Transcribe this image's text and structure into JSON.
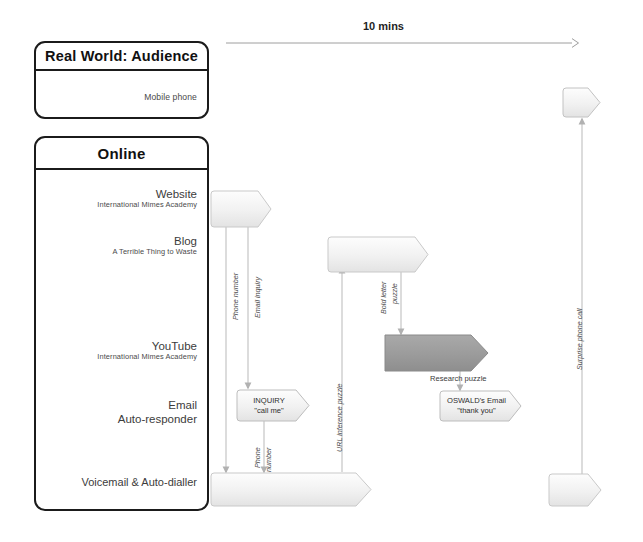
{
  "diagram": {
    "timeline": {
      "label": "10 mins"
    },
    "panels": [
      {
        "id": "real-world",
        "title": "Real World: Audience",
        "lanes": [
          {
            "title": "Mobile phone",
            "sub": ""
          }
        ]
      },
      {
        "id": "online",
        "title": "Online",
        "lanes": [
          {
            "title": "Website",
            "sub": "International Mimes Academy"
          },
          {
            "title": "Blog",
            "sub": "A Terrible Thing to Waste"
          },
          {
            "title": "YouTube",
            "sub": "International Mimes Academy"
          },
          {
            "title": "Email",
            "sub": "Auto-responder"
          },
          {
            "title": "Voicemail & Auto-dialler",
            "sub": ""
          }
        ]
      }
    ],
    "nodes": [
      {
        "id": "website-node",
        "line1": "",
        "line2": "",
        "fill": "light"
      },
      {
        "id": "blog-node",
        "line1": "",
        "line2": "",
        "fill": "light"
      },
      {
        "id": "youtube-node",
        "line1": "",
        "line2": "",
        "fill": "dark"
      },
      {
        "id": "inquiry-node",
        "line1": "INQUIRY",
        "line2": "\"call me\"",
        "fill": "light"
      },
      {
        "id": "oswald-email-node",
        "line1": "OSWALD's Email",
        "line2": "\"thank you\"",
        "fill": "light"
      },
      {
        "id": "voicemail-node",
        "line1": "",
        "line2": "",
        "fill": "light"
      },
      {
        "id": "mobile-phone-node",
        "line1": "",
        "line2": "",
        "fill": "light"
      },
      {
        "id": "mobile-phone-bottom-node",
        "line1": "",
        "line2": "",
        "fill": "light"
      }
    ],
    "connector_labels": [
      {
        "id": "phone-number-1",
        "text": "Phone number"
      },
      {
        "id": "email-inquiry",
        "text": "Email inquiry"
      },
      {
        "id": "phone-number-2a",
        "text": "Phone"
      },
      {
        "id": "phone-number-2b",
        "text": "number"
      },
      {
        "id": "url-inference",
        "text": "URL inference puzzle"
      },
      {
        "id": "bold-letter-a",
        "text": "Bold letter"
      },
      {
        "id": "bold-letter-b",
        "text": "puzzle"
      },
      {
        "id": "research-puzzle",
        "text": "Research puzzle"
      },
      {
        "id": "surprise-call",
        "text": "Surprise phone call"
      }
    ],
    "colors": {
      "node_light": "#efefef",
      "node_dark": "#9a9a9a",
      "panel_border": "#1b1b1b",
      "connector": "#b9b9b9"
    }
  }
}
